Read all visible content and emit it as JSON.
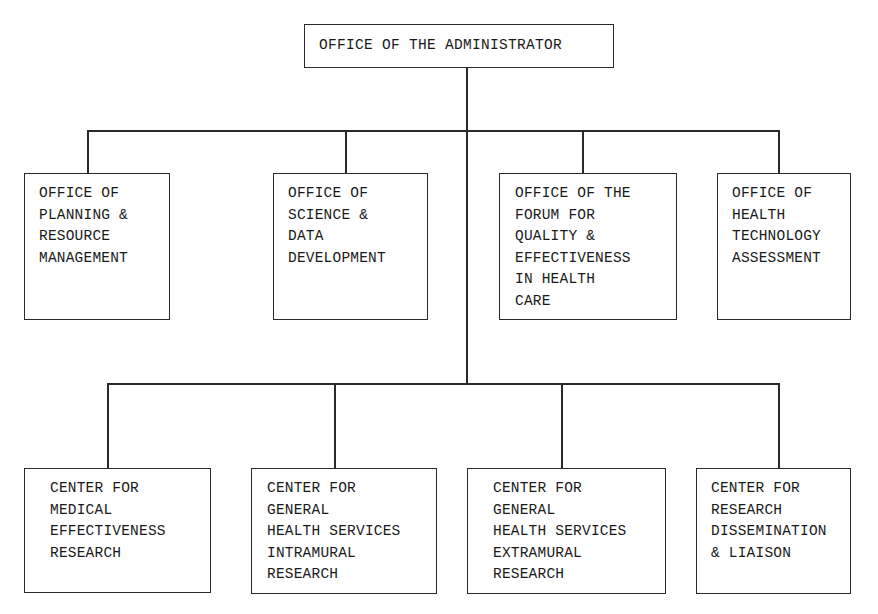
{
  "chart": {
    "root": {
      "label": "OFFICE OF THE ADMINISTRATOR"
    },
    "offices": [
      {
        "lines": [
          "OFFICE OF",
          "PLANNING &",
          "RESOURCE",
          "MANAGEMENT"
        ]
      },
      {
        "lines": [
          "OFFICE OF",
          "SCIENCE &",
          "DATA",
          "DEVELOPMENT"
        ]
      },
      {
        "lines": [
          "OFFICE OF THE",
          "FORUM FOR",
          "QUALITY &",
          "EFFECTIVENESS",
          "IN HEALTH",
          "CARE"
        ]
      },
      {
        "lines": [
          "OFFICE OF",
          "HEALTH",
          "TECHNOLOGY",
          "ASSESSMENT"
        ]
      }
    ],
    "centers": [
      {
        "lines": [
          "CENTER FOR",
          "MEDICAL",
          "EFFECTIVENESS",
          "RESEARCH"
        ]
      },
      {
        "lines": [
          "CENTER FOR",
          "GENERAL",
          "HEALTH SERVICES",
          "INTRAMURAL",
          "RESEARCH"
        ]
      },
      {
        "lines": [
          "CENTER FOR",
          "GENERAL",
          "HEALTH SERVICES",
          "EXTRAMURAL",
          "RESEARCH"
        ]
      },
      {
        "lines": [
          "CENTER FOR",
          "RESEARCH",
          "DISSEMINATION",
          "& LIAISON"
        ]
      }
    ]
  },
  "colors": {
    "line": "#2a2a2a",
    "text": "#1a1a1a",
    "background": "#ffffff"
  }
}
